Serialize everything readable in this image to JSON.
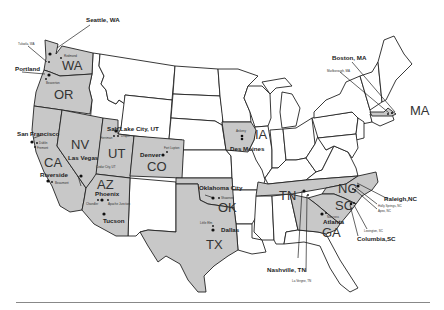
{
  "map": {
    "title": "",
    "highlighted_states": [
      {
        "abbr": "WA",
        "label": "WA"
      },
      {
        "abbr": "OR",
        "label": "OR"
      },
      {
        "abbr": "CA",
        "label": "CA"
      },
      {
        "abbr": "NV",
        "label": "NV"
      },
      {
        "abbr": "UT",
        "label": "UT"
      },
      {
        "abbr": "AZ",
        "label": "AZ"
      },
      {
        "abbr": "CO",
        "label": "CO"
      },
      {
        "abbr": "OK",
        "label": "OK"
      },
      {
        "abbr": "TX",
        "label": "TX"
      },
      {
        "abbr": "IA",
        "label": "IA"
      },
      {
        "abbr": "TN",
        "label": "TN"
      },
      {
        "abbr": "NC",
        "label": "NC"
      },
      {
        "abbr": "SC",
        "label": "SC"
      },
      {
        "abbr": "GA",
        "label": "GA"
      },
      {
        "abbr": "MA",
        "label": "MA"
      }
    ],
    "major_cities": {
      "seattle": "Seattle, WA",
      "portland": "Portland",
      "san_francisco": "San Francisco",
      "las_vegas": "Las Vegas",
      "salt_lake_city": "Salt Lake City, UT",
      "riverside": "Riverside",
      "phoenix": "Phoenix",
      "tucson": "Tucson",
      "denver": "Denver",
      "oklahoma_city": "Oklahoma City",
      "dallas": "Dallas",
      "des_moines": "Des Moines",
      "boston": "Boston, MA",
      "raleigh": "Raleigh,NC",
      "columbia": "Columbia,SC",
      "atlanta": "Atlanta",
      "nashville": "Nashville, TN"
    },
    "minor_cities": {
      "tukwila": "Tukwila, WA",
      "redmond": "Redmond",
      "beaverton": "Beaverton",
      "dublin": "Dublin",
      "fremont": "Fremont",
      "beaumont": "Beaumont",
      "herriman": "Herriman",
      "draper": "Draper",
      "cedar_city": "Cedar City, UT",
      "chandler": "Chandler",
      "apache_junction": "Apache Junction",
      "fort_lupton": "Fort Lupton",
      "shawnee": "Shawnee",
      "little_elm": "Little Elm",
      "ankeny": "Ankeny",
      "marlborough": "Marlborough, MA",
      "holly_springs": "Holly Springs, NC",
      "apex": "Apex, NC",
      "lexington_sc": "Lexington, SC",
      "norcross": "Norcross",
      "lavergne": "La Vergne, TN"
    },
    "colors": {
      "highlight_fill": "#c8c8c8",
      "plain_fill": "#ffffff",
      "border": "#222222"
    }
  }
}
